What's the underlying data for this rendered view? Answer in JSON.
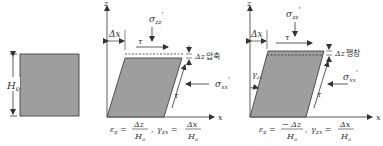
{
  "colors": {
    "fill": "#9e9e9e",
    "stroke": "#333333",
    "text": "#333333"
  },
  "panel_original": {
    "height_label": "H",
    "height_sub": "o"
  },
  "panel_compression": {
    "axis_z": "z",
    "axis_x": "x",
    "dx_label": "Δx",
    "sigma_top": "σ",
    "sigma_top_sub": "zz",
    "sigma_prime": "'",
    "tau_top": "τ",
    "tau_side": "τ",
    "dz_label": "Δz",
    "dz_word": "압축",
    "sigma_side": "σ",
    "sigma_side_sub": "xx",
    "eps": "ε",
    "eps_sub": "z",
    "eps_eq": " = ",
    "eps_num": "Δz",
    "eps_den": "H",
    "eps_den_sub": "o",
    "gamma": "γ",
    "gamma_sub": "zx",
    "gamma_eq": " = ",
    "gamma_num": "Δx",
    "gamma_den": "H",
    "gamma_den_sub": "o",
    "sep": ","
  },
  "panel_expansion": {
    "axis_z": "z",
    "axis_x": "x",
    "dx_label": "Δx",
    "sigma_top": "σ",
    "sigma_top_sub": "zz",
    "sigma_prime": "'",
    "tau_top": "τ",
    "tau_side": "τ",
    "dz_label": "Δz",
    "dz_word": "팽창",
    "sigma_side": "σ",
    "sigma_side_sub": "xx",
    "gamma_angle": "γ",
    "gamma_angle_sub": "zx",
    "eps": "ε",
    "eps_sub": "z",
    "eps_eq": " = ",
    "eps_num": "− Δz",
    "eps_den": "H",
    "eps_den_sub": "o",
    "gamma": "γ",
    "gamma_sub": "zx",
    "gamma_eq": " = ",
    "gamma_num": "Δx",
    "gamma_den": "H",
    "gamma_den_sub": "o",
    "sep": ","
  }
}
